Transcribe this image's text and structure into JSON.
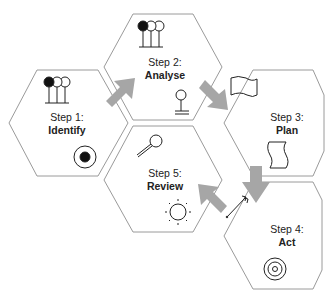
{
  "diagram": {
    "colors": {
      "hex_stroke": "#9a9a9a",
      "arrow_fill": "#a6a6a6",
      "icon_stroke": "#222222",
      "text": "#222222"
    },
    "steps": [
      {
        "step": "Step 1:",
        "name": "Identify",
        "icons": [
          "lollipop-group-icon",
          "target-dot-icon"
        ]
      },
      {
        "step": "Step 2:",
        "name": "Analyse",
        "icons": [
          "lollipop-group-icon",
          "joystick-icon"
        ]
      },
      {
        "step": "Step 3:",
        "name": "Plan",
        "icons": [
          "flag-icon",
          "scroll-document-icon"
        ]
      },
      {
        "step": "Step 4:",
        "name": "Act",
        "icons": [
          "arrow-dart-icon",
          "concentric-target-icon"
        ]
      },
      {
        "step": "Step 5:",
        "name": "Review",
        "icons": [
          "magnifier-icon",
          "sun-icon"
        ]
      }
    ],
    "flow": [
      "Identify",
      "Analyse",
      "Plan",
      "Act",
      "Review"
    ]
  }
}
